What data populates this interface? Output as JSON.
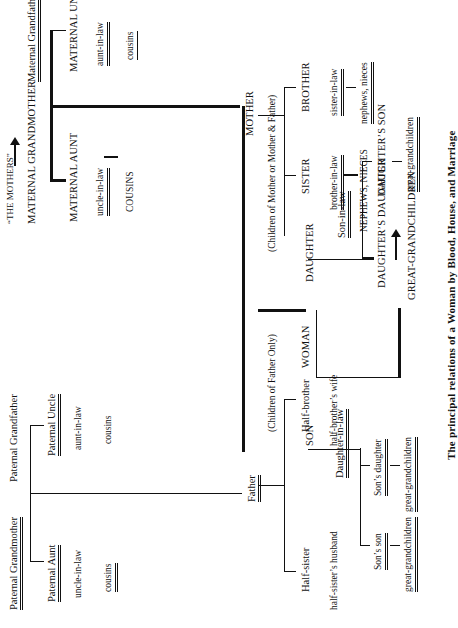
{
  "title": "The principal relations of a Woman by Blood, House, and Marriage",
  "annotations": {
    "the_mothers": "“THE MOTHERS”",
    "children_of_father_only": "(Children of Father Only)",
    "children_of_mother_or_both": "(Children of Mother or Mother & Father)"
  },
  "paternal": {
    "grandmother": "Paternal Grandmother",
    "grandfather": "Paternal Grandfather",
    "aunt": "Paternal Aunt",
    "aunt_spouse": "uncle-in-law",
    "aunt_children": "cousins",
    "uncle": "Paternal Uncle",
    "uncle_spouse": "aunt-in-law",
    "uncle_children": "cousins",
    "father": "Father"
  },
  "maternal": {
    "grandmother": "MATERNAL GRANDMOTHER",
    "grandfather": "Maternal Grandfather",
    "aunt": "MATERNAL AUNT",
    "aunt_spouse": "uncle-in-law",
    "aunt_children": "COUSINS",
    "uncle": "MATERNAL UNCLE",
    "uncle_spouse": "aunt-in-law",
    "uncle_children": "cousins",
    "mother": "MOTHER"
  },
  "half_siblings": {
    "half_brother": "Half-brother",
    "half_brother_spouse": "half-brother’s wife",
    "half_sister": "Half-sister",
    "half_sister_spouse": "half-sister’s husband"
  },
  "siblings": {
    "brother": "BROTHER",
    "brother_spouse": "sister-in-law",
    "brother_children": "nephews, nieces",
    "sister": "SISTER",
    "sister_spouse": "brother-in-law",
    "sister_children": "NEPHEWS, NIECES"
  },
  "ego": {
    "label": "WOMAN"
  },
  "children": {
    "son": "SON",
    "son_spouse": "Daughter-in-law",
    "daughter": "DAUGHTER",
    "daughter_spouse": "Son-in-law"
  },
  "grandchildren": {
    "sons_daughter": "Son’s daughter",
    "sons_daughter_children": "great-grandchildren",
    "sons_son": "Son’s son",
    "sons_son_children": "great-grandchildren",
    "daughters_daughter": "DAUGHTER’S DAUGHTER",
    "daughters_daughter_children": "GREAT-GRANDCHILDREN",
    "daughters_son": "DAUGHTER’S SON",
    "daughters_son_children": "great-grandchildren"
  }
}
